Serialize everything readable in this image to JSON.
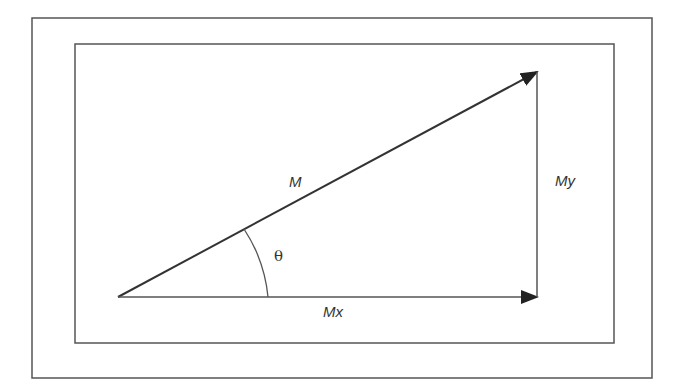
{
  "diagram": {
    "title": "",
    "type": "vector-decomposition",
    "labels": {
      "magnitude": "M",
      "x_component": "Mx",
      "y_component": "My",
      "angle": "θ"
    },
    "colors": {
      "line": "#333333",
      "frame": "#555555",
      "background": "#ffffff"
    }
  }
}
